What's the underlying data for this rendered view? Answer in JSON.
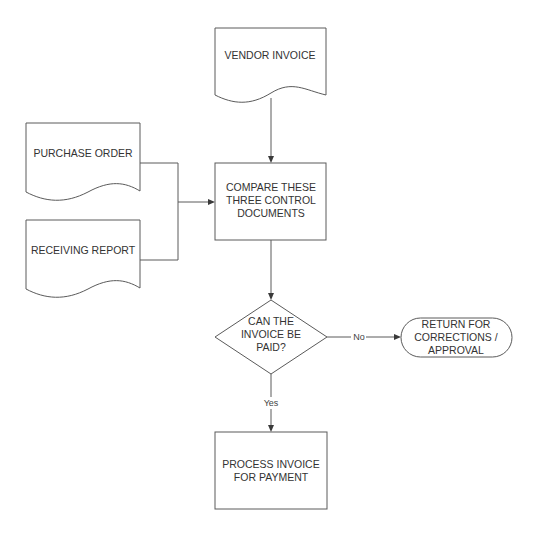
{
  "diagram": {
    "type": "flowchart",
    "nodes": {
      "vendor_invoice": {
        "shape": "document",
        "lines": [
          "VENDOR INVOICE"
        ]
      },
      "purchase_order": {
        "shape": "document",
        "lines": [
          "PURCHASE ORDER"
        ]
      },
      "receiving_report": {
        "shape": "document",
        "lines": [
          "RECEIVING REPORT"
        ]
      },
      "compare": {
        "shape": "process",
        "lines": [
          "COMPARE THESE",
          "THREE CONTROL",
          "DOCUMENTS"
        ]
      },
      "decision": {
        "shape": "decision",
        "lines": [
          "CAN THE",
          "INVOICE BE",
          "PAID?"
        ]
      },
      "return": {
        "shape": "terminator",
        "lines": [
          "RETURN FOR",
          "CORRECTIONS /",
          "APPROVAL"
        ]
      },
      "process": {
        "shape": "process",
        "lines": [
          "PROCESS INVOICE",
          "FOR PAYMENT"
        ]
      }
    },
    "edges": {
      "no_label": "No",
      "yes_label": "Yes"
    },
    "colors": {
      "stroke": "#5a5a5a",
      "text": "#333333",
      "background": "#ffffff"
    }
  }
}
